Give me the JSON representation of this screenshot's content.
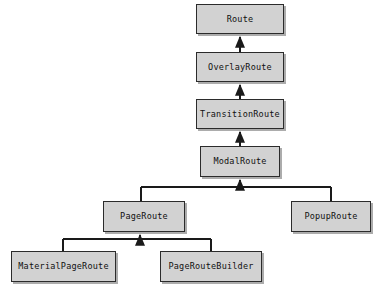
{
  "diagram": {
    "kind": "uml-class-inheritance",
    "background_color": "#ffffff",
    "node_fill_color": "#d2d2d2",
    "node_border_color": "#2b2b2b",
    "edge_color": "#1a1a1a",
    "arrow_style": "solid-filled-triangle",
    "arrow_direction": "subclass-to-superclass"
  },
  "nodes": [
    {
      "id": "route",
      "label": "Route",
      "x": 196,
      "y": 4,
      "w": 88,
      "h": 30
    },
    {
      "id": "overlay_route",
      "label": "OverlayRoute",
      "x": 196,
      "y": 52,
      "w": 88,
      "h": 30
    },
    {
      "id": "transition_route",
      "label": "TransitionRoute",
      "x": 196,
      "y": 99,
      "w": 88,
      "h": 30
    },
    {
      "id": "modal_route",
      "label": "ModalRoute",
      "x": 200,
      "y": 146,
      "w": 80,
      "h": 31
    },
    {
      "id": "page_route",
      "label": "PageRoute",
      "x": 103,
      "y": 201,
      "w": 82,
      "h": 31
    },
    {
      "id": "popup_route",
      "label": "PopupRoute",
      "x": 291,
      "y": 201,
      "w": 80,
      "h": 31
    },
    {
      "id": "material_page_route",
      "label": "MaterialPageRoute",
      "x": 11,
      "y": 251,
      "w": 105,
      "h": 31
    },
    {
      "id": "page_route_builder",
      "label": "PageRouteBuilder",
      "x": 160,
      "y": 251,
      "w": 102,
      "h": 31
    }
  ],
  "edges": [
    {
      "from": "overlay_route",
      "to": "route",
      "relation": "extends"
    },
    {
      "from": "transition_route",
      "to": "overlay_route",
      "relation": "extends"
    },
    {
      "from": "modal_route",
      "to": "transition_route",
      "relation": "extends"
    },
    {
      "from": "page_route",
      "to": "modal_route",
      "relation": "extends"
    },
    {
      "from": "popup_route",
      "to": "modal_route",
      "relation": "extends"
    },
    {
      "from": "material_page_route",
      "to": "page_route",
      "relation": "extends"
    },
    {
      "from": "page_route_builder",
      "to": "page_route",
      "relation": "extends"
    }
  ]
}
